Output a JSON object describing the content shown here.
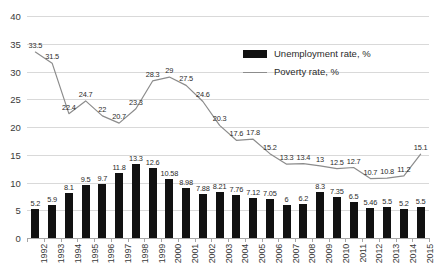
{
  "chart_data": {
    "type": "bar",
    "title": "",
    "subtitle": "",
    "xlabel": "",
    "ylabel": "",
    "ylim": [
      0,
      40
    ],
    "ytick_step": 5,
    "yticks": [
      "0",
      "5",
      "10",
      "15",
      "20",
      "25",
      "30",
      "35",
      "40"
    ],
    "grid": true,
    "legend_position": "top-right",
    "categories": [
      "1992",
      "1993",
      "1994",
      "1995",
      "1996",
      "1997",
      "1998",
      "1999",
      "2000",
      "2001",
      "2002",
      "2003",
      "2004",
      "2005",
      "2006",
      "2007",
      "2008",
      "2009",
      "2010",
      "2011",
      "2012",
      "2013",
      "2014",
      "2015"
    ],
    "series": [
      {
        "name": "Unemployment rate, %",
        "type": "bar",
        "color": "#111111",
        "values": [
          5.2,
          5.9,
          8.1,
          9.5,
          9.7,
          11.8,
          13.3,
          12.6,
          10.58,
          8.98,
          7.88,
          8.21,
          7.76,
          7.12,
          7.05,
          6,
          6.2,
          8.3,
          7.35,
          6.5,
          5.46,
          5.5,
          5.2,
          5.5
        ],
        "labels": [
          "5.2",
          "5.9",
          "8.1",
          "9.5",
          "9.7",
          "11.8",
          "13.3",
          "12.6",
          "10.58",
          "8.98",
          "7.88",
          "8.21",
          "7.76",
          "7.12",
          "7.05",
          "6",
          "6.2",
          "8.3",
          "7.35",
          "6.5",
          "5.46",
          "5.5",
          "5.2",
          "5.5"
        ]
      },
      {
        "name": "Poverty rate, %",
        "type": "line",
        "color": "#8c8c8c",
        "values": [
          33.5,
          31.5,
          22.4,
          24.7,
          22,
          20.7,
          23.3,
          28.3,
          29,
          27.5,
          24.6,
          20.3,
          17.6,
          17.8,
          15.2,
          13.3,
          13.4,
          13,
          12.5,
          12.7,
          10.7,
          10.8,
          11.2,
          15.1
        ],
        "labels": [
          "33.5",
          "31.5",
          "22.4",
          "24.7",
          "22",
          "20.7",
          "23.3",
          "28.3",
          "29",
          "27.5",
          "24.6",
          "20.3",
          "17.6",
          "17.8",
          "15.2",
          "13.3",
          "13.4",
          "13",
          "12.5",
          "12.7",
          "10.7",
          "10.8",
          "11.2",
          "15.1"
        ]
      }
    ]
  },
  "legend": {
    "items": [
      {
        "label": "Unemployment rate, %",
        "marker": "bar-swatch"
      },
      {
        "label": "Poverty rate, %",
        "marker": "line-swatch"
      }
    ]
  },
  "colors": {
    "bar": "#111111",
    "line": "#8c8c8c",
    "grid": "#d9d9d9",
    "axis": "#a6a6a6",
    "text": "#2b2b2b",
    "background": "#ffffff"
  }
}
